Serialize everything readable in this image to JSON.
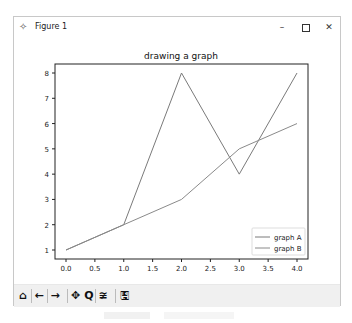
{
  "window": {
    "title": "Figure 1",
    "icon": "matplotlib-figure-icon",
    "controls": {
      "minimize": "–",
      "maximize": "maximize-icon",
      "close": "✕"
    }
  },
  "toolbar": {
    "buttons": [
      {
        "name": "home",
        "glyph": "⌂",
        "icon": "home-icon"
      },
      {
        "name": "back",
        "glyph": "←",
        "icon": "arrow-left-icon"
      },
      {
        "name": "forward",
        "glyph": "→",
        "icon": "arrow-right-icon"
      },
      {
        "name": "pan",
        "glyph": "✥",
        "icon": "pan-icon"
      },
      {
        "name": "zoom",
        "glyph": "Q",
        "icon": "zoom-icon"
      },
      {
        "name": "configure-subplots",
        "glyph": "≆",
        "icon": "sliders-icon"
      },
      {
        "name": "save",
        "glyph": "🖫",
        "icon": "save-icon"
      }
    ]
  },
  "colors": {
    "line_a": "#7a7a7a",
    "line_b": "#8a8a8a",
    "axes": "#222222",
    "window_border": "#c8c8c8",
    "toolbar_bg": "#f0f0f0"
  },
  "chart_data": {
    "type": "line",
    "title": "drawing a graph",
    "xlabel": "",
    "ylabel": "",
    "x": [
      0,
      1,
      2,
      3,
      4
    ],
    "series": [
      {
        "name": "graph A",
        "values": [
          1,
          2,
          8,
          4,
          8
        ]
      },
      {
        "name": "graph B",
        "values": [
          1,
          2,
          3,
          5,
          6
        ]
      }
    ],
    "xticks": [
      "0.0",
      "0.5",
      "1.0",
      "1.5",
      "2.0",
      "2.5",
      "3.0",
      "3.5",
      "4.0"
    ],
    "yticks": [
      "1",
      "2",
      "3",
      "4",
      "5",
      "6",
      "7",
      "8"
    ],
    "xlim": [
      -0.2,
      4.2
    ],
    "ylim": [
      0.65,
      8.35
    ],
    "grid": false,
    "legend_position": "lower right"
  }
}
